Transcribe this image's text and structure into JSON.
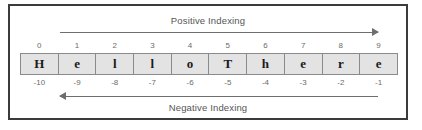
{
  "frame": {
    "border_color": "#3b3b3b"
  },
  "labels": {
    "positive": "Positive Indexing",
    "negative": "Negative Indexing"
  },
  "arrows": {
    "positive": {
      "direction": "right",
      "color": "#6e6e6e"
    },
    "negative": {
      "direction": "left",
      "color": "#6e6e6e"
    }
  },
  "chart_data": {
    "type": "table",
    "columns": 10,
    "row_labels": [
      "Positive Index",
      "Character",
      "Negative Index"
    ],
    "positive_indices": [
      0,
      1,
      2,
      3,
      4,
      5,
      6,
      7,
      8,
      9
    ],
    "characters": [
      "H",
      "e",
      "l",
      "l",
      "o",
      "T",
      "h",
      "e",
      "r",
      "e"
    ],
    "negative_indices": [
      -10,
      -9,
      -8,
      -7,
      -6,
      -5,
      -4,
      -3,
      -2,
      -1
    ],
    "string_value": "HelloThere",
    "cell_fill": "#e3e3e3",
    "cell_border": "#8a8a8a",
    "index_text_color": "#6b6b6b",
    "char_text_color": "#1a1a1a"
  }
}
